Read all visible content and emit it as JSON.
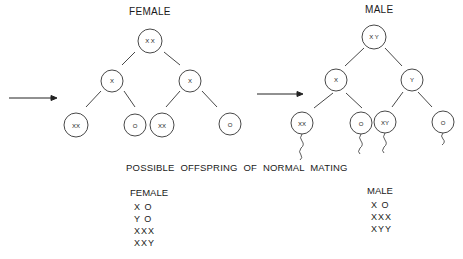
{
  "female_tree": {
    "title": "FEMALE",
    "root": "X X",
    "level1": [
      "X",
      "X"
    ],
    "level2": [
      "XX",
      "O",
      "XX",
      "O"
    ]
  },
  "male_tree": {
    "title": "MALE",
    "root": "X Y",
    "level1": [
      "X",
      "Y"
    ],
    "level2": [
      "XX",
      "O",
      "XY",
      "O"
    ]
  },
  "caption": "POSSIBLE OFFSPRING OF NORMAL MATING",
  "offspring": {
    "female": {
      "heading": "FEMALE",
      "items": [
        "X O",
        "Y O",
        "XXX",
        "XXY"
      ]
    },
    "male": {
      "heading": "MALE",
      "items": [
        "X O",
        "XXX",
        "XYY"
      ]
    }
  },
  "icons": {
    "arrow": "right-arrow-icon",
    "sperm_tail": "sperm-tail-icon"
  }
}
